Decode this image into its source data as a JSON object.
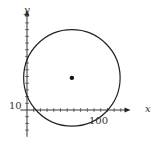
{
  "chart_data": {
    "type": "scatter",
    "title": "",
    "xlabel": "x",
    "ylabel": "y",
    "tick_labels": {
      "x": [
        "100"
      ],
      "y": [
        "10"
      ]
    },
    "tick_spacing": 10,
    "xlim": [
      -10,
      150
    ],
    "ylim": [
      -40,
      145
    ],
    "shapes": [
      {
        "kind": "circle",
        "center": [
          67,
          48
        ],
        "radius": 72
      }
    ],
    "points": [
      {
        "x": 67,
        "y": 48,
        "label": "center"
      }
    ],
    "grid": false,
    "legend": null
  },
  "labels": {
    "x_axis": "x",
    "y_axis": "y",
    "x_tick": "100",
    "y_tick": "10"
  },
  "colors": {
    "ink": "#222222"
  }
}
